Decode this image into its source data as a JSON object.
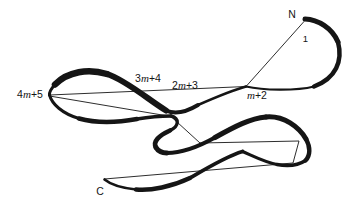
{
  "figure": {
    "background_color": "#ffffff",
    "ink_color": "#151515",
    "labels": {
      "n_terminus": {
        "text": "N"
      },
      "first_residue": {
        "text": "1"
      },
      "m_plus_2": {
        "prefix": "",
        "variable": "m",
        "suffix": "+2"
      },
      "two_m_plus_3": {
        "prefix": "2",
        "variable": "m",
        "suffix": "+3"
      },
      "three_m_plus_4": {
        "prefix": "3",
        "variable": "m",
        "suffix": "+4"
      },
      "four_m_plus_5": {
        "prefix": "4",
        "variable": "m",
        "suffix": "+5"
      },
      "c_terminus": {
        "text": "C"
      }
    }
  }
}
